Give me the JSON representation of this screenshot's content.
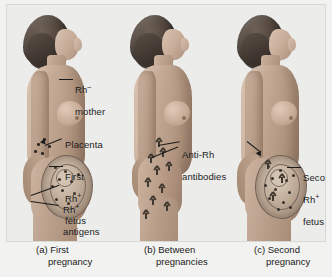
{
  "figure": {
    "background_color": "#ececeb",
    "text_color": "#1b1b1b"
  },
  "panels": [
    {
      "id": "a",
      "caption_prefix": "(a) First",
      "caption_second": "pregnancy",
      "labels": [
        {
          "name": "rh-negative-mother",
          "line1": "Rh",
          "sup": "–",
          "line2": "mother"
        },
        {
          "name": "placenta",
          "line1": "Placenta",
          "sup": "",
          "line2": ""
        },
        {
          "name": "first-rh-positive-fetus",
          "line1": "First",
          "sup": "+",
          "line2": "Rh",
          "line3": "fetus"
        },
        {
          "name": "rh-positive-antigens",
          "line1": "Rh",
          "sup": "+",
          "line2": "antigens"
        }
      ]
    },
    {
      "id": "b",
      "caption_prefix": "(b) Between",
      "caption_second": "pregnancies",
      "labels": [
        {
          "name": "anti-rh-antibodies",
          "line1": "Anti-Rh",
          "sup": "",
          "line2": "antibodies"
        }
      ]
    },
    {
      "id": "c",
      "caption_prefix": "(c) Second",
      "caption_second": "pregnancy",
      "labels": [
        {
          "name": "second-rh-positive-fetus",
          "line1": "Second",
          "sup": "+",
          "line2": "Rh",
          "line3": "fetus"
        }
      ]
    }
  ],
  "text": {
    "rh_mother_l1": "Rh",
    "rh_mother_sup": "–",
    "rh_mother_l2": "mother",
    "placenta": "Placenta",
    "first_fetus_l1": "First",
    "first_fetus_l2": "Rh",
    "first_fetus_sup": "+",
    "first_fetus_l3": "fetus",
    "antigens_l1": "Rh",
    "antigens_sup": "+",
    "antigens_l2": "antigens",
    "antibodies_l1": "Anti-Rh",
    "antibodies_l2": "antibodies",
    "second_fetus_l1": "Second",
    "second_fetus_l2": "Rh",
    "second_fetus_sup": "+",
    "second_fetus_l3": "fetus",
    "cap_a1": "(a) First",
    "cap_a2": "pregnancy",
    "cap_b1": "(b) Between",
    "cap_b2": "pregnancies",
    "cap_c1": "(c) Second",
    "cap_c2": "pregnancy"
  }
}
